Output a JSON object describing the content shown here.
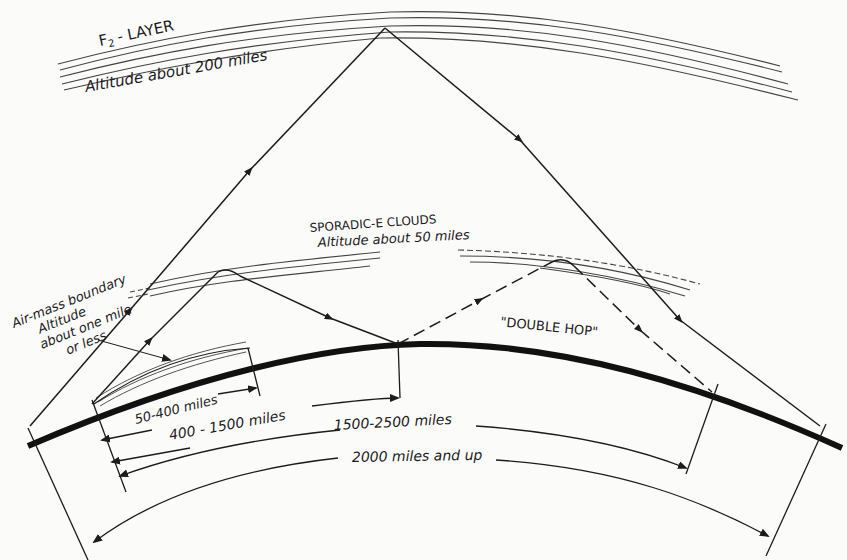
{
  "diagram": {
    "colors": {
      "ink": "#1c1c1c",
      "paper": "#fbfbfa"
    },
    "layers": {
      "f2": {
        "name": "F2 - LAYER",
        "name_main": "F",
        "name_sub": "2",
        "name_rest": "- LAYER",
        "altitude": "Altitude about 200 miles"
      },
      "sporadic_e": {
        "name": "SPORADIC-E CLOUDS",
        "altitude": "Altitude about 50 miles"
      },
      "air_mass": {
        "line1": "Air-mass boundary",
        "line2": "Altitude",
        "line3": "about one mile",
        "line4": "or less"
      }
    },
    "annotations": {
      "double_hop": "\"DOUBLE HOP\""
    },
    "ranges": [
      {
        "label": "50-400 miles"
      },
      {
        "label": "400 - 1500 miles"
      },
      {
        "label": "1500-2500 miles"
      },
      {
        "label": "2000 miles and up"
      }
    ]
  }
}
